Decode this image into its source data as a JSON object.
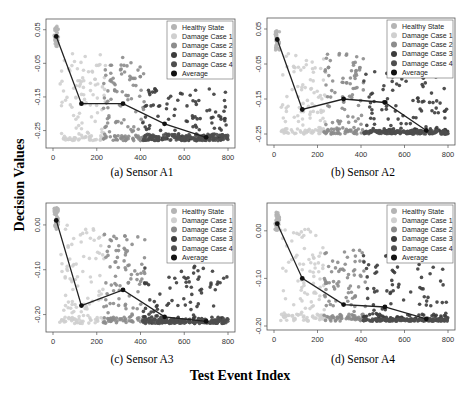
{
  "figure": {
    "ylabel": "Decision Values",
    "xlabel": "Test Event Index",
    "legend": [
      "Healthy State",
      "Damage Case 1",
      "Damage Case 2",
      "Damage Case 3",
      "Damage Case 4",
      "Average"
    ],
    "colors": {
      "Healthy State": "#b4b4b4",
      "Damage Case 1": "#cfcfcf",
      "Damage Case 2": "#8c8c8c",
      "Damage Case 3": "#3c3c3c",
      "Damage Case 4": "#4e4e4e",
      "Average": "#111111"
    }
  },
  "chart_data": [
    {
      "type": "scatter",
      "title": "(a) Sensor A1",
      "xlabel": "Test Event Index",
      "ylabel": "Decision Values",
      "xlim": [
        0,
        800
      ],
      "xticks": [
        0,
        200,
        400,
        600,
        800
      ],
      "ylim": [
        -0.29,
        0.07
      ],
      "yticks": [
        0.05,
        -0.05,
        -0.15,
        -0.25
      ],
      "ytick_labels": [
        "0.05",
        "-0.05",
        "-0.15",
        "-0.25"
      ],
      "legend_position": "top-right",
      "average": {
        "x": [
          15,
          130,
          320,
          510,
          700
        ],
        "y": [
          0.03,
          -0.17,
          -0.17,
          -0.23,
          -0.27
        ]
      },
      "clusters": [
        {
          "name": "Healthy State",
          "x": [
            5,
            25
          ],
          "y": [
            0.0,
            0.06
          ]
        },
        {
          "name": "Damage Case 1",
          "x": [
            30,
            240
          ],
          "y": [
            -0.28,
            -0.02
          ]
        },
        {
          "name": "Damage Case 2",
          "x": [
            230,
            420
          ],
          "y": [
            -0.28,
            -0.03
          ]
        },
        {
          "name": "Damage Case 3",
          "x": [
            410,
            800
          ],
          "y": [
            -0.28,
            -0.12
          ]
        },
        {
          "name": "Damage Case 4",
          "x": [
            410,
            800
          ],
          "y": [
            -0.28,
            -0.26
          ]
        }
      ]
    },
    {
      "type": "scatter",
      "title": "(b) Sensor A2",
      "xlabel": "Test Event Index",
      "ylabel": "Decision Values",
      "xlim": [
        0,
        800
      ],
      "xticks": [
        0,
        200,
        400,
        600,
        800
      ],
      "ylim": [
        -0.27,
        0.07
      ],
      "yticks": [
        0.05,
        -0.05,
        -0.15,
        -0.25
      ],
      "ytick_labels": [
        "0.05",
        "-0.05",
        "-0.15",
        "-0.25"
      ],
      "legend_position": "top-right",
      "average": {
        "x": [
          15,
          130,
          320,
          510,
          700
        ],
        "y": [
          0.02,
          -0.18,
          -0.15,
          -0.16,
          -0.24
        ]
      },
      "clusters": [
        {
          "name": "Healthy State",
          "x": [
            5,
            25
          ],
          "y": [
            -0.01,
            0.05
          ]
        },
        {
          "name": "Damage Case 1",
          "x": [
            30,
            240
          ],
          "y": [
            -0.25,
            -0.02
          ]
        },
        {
          "name": "Damage Case 2",
          "x": [
            230,
            420
          ],
          "y": [
            -0.25,
            -0.02
          ]
        },
        {
          "name": "Damage Case 3",
          "x": [
            410,
            800
          ],
          "y": [
            -0.25,
            -0.07
          ]
        },
        {
          "name": "Damage Case 4",
          "x": [
            410,
            800
          ],
          "y": [
            -0.25,
            -0.24
          ]
        }
      ]
    },
    {
      "type": "scatter",
      "title": "(c) Sensor A3",
      "xlabel": "Test Event Index",
      "ylabel": "Decision Values",
      "xlim": [
        0,
        800
      ],
      "xticks": [
        0,
        200,
        400,
        600,
        800
      ],
      "ylim": [
        -0.23,
        0.04
      ],
      "yticks": [
        0.0,
        -0.1,
        -0.2
      ],
      "ytick_labels": [
        "0.00",
        "-0.10",
        "-0.20"
      ],
      "legend_position": "top-right",
      "average": {
        "x": [
          15,
          130,
          320,
          510,
          700
        ],
        "y": [
          0.01,
          -0.18,
          -0.145,
          -0.205,
          -0.215
        ]
      },
      "clusters": [
        {
          "name": "Healthy State",
          "x": [
            5,
            25
          ],
          "y": [
            -0.01,
            0.04
          ]
        },
        {
          "name": "Damage Case 1",
          "x": [
            30,
            240
          ],
          "y": [
            -0.22,
            0.0
          ]
        },
        {
          "name": "Damage Case 2",
          "x": [
            230,
            420
          ],
          "y": [
            -0.22,
            -0.02
          ]
        },
        {
          "name": "Damage Case 3",
          "x": [
            410,
            800
          ],
          "y": [
            -0.22,
            -0.09
          ]
        },
        {
          "name": "Damage Case 4",
          "x": [
            410,
            800
          ],
          "y": [
            -0.22,
            -0.21
          ]
        }
      ]
    },
    {
      "type": "scatter",
      "title": "(d) Sensor A4",
      "xlabel": "Test Event Index",
      "ylabel": "Decision Values",
      "xlim": [
        0,
        800
      ],
      "xticks": [
        0,
        200,
        400,
        600,
        800
      ],
      "ylim": [
        -0.2,
        0.05
      ],
      "yticks": [
        0.0,
        -0.1,
        -0.2
      ],
      "ytick_labels": [
        "0.00",
        "-0.10",
        "-0.20"
      ],
      "legend_position": "top-right",
      "average": {
        "x": [
          15,
          130,
          320,
          510,
          700
        ],
        "y": [
          0.015,
          -0.1,
          -0.155,
          -0.16,
          -0.185
        ]
      },
      "clusters": [
        {
          "name": "Healthy State",
          "x": [
            5,
            25
          ],
          "y": [
            0.0,
            0.04
          ]
        },
        {
          "name": "Damage Case 1",
          "x": [
            30,
            240
          ],
          "y": [
            -0.19,
            0.01
          ]
        },
        {
          "name": "Damage Case 2",
          "x": [
            230,
            420
          ],
          "y": [
            -0.19,
            -0.03
          ]
        },
        {
          "name": "Damage Case 3",
          "x": [
            410,
            800
          ],
          "y": [
            -0.19,
            -0.05
          ]
        },
        {
          "name": "Damage Case 4",
          "x": [
            410,
            800
          ],
          "y": [
            -0.19,
            -0.185
          ]
        }
      ]
    }
  ]
}
